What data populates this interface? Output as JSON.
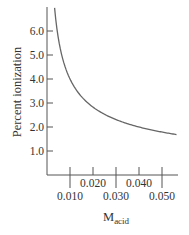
{
  "chart_data": {
    "type": "line",
    "title": "",
    "xlabel": "M",
    "xlabel_subscript": "acid",
    "ylabel": "Percent ionization",
    "xlim": [
      0,
      0.056
    ],
    "ylim": [
      0,
      7.0
    ],
    "grid": false,
    "legend": null,
    "x_ticks_lower": [
      "0.010",
      "0.030",
      "0.050"
    ],
    "x_ticks_upper": [
      "0.020",
      "0.040"
    ],
    "x_tick_values": [
      0.01,
      0.02,
      0.03,
      0.04,
      0.05
    ],
    "y_ticks": [
      "1.0",
      "2.0",
      "3.0",
      "4.0",
      "5.0",
      "6.0"
    ],
    "y_tick_values": [
      1.0,
      2.0,
      3.0,
      4.0,
      5.0,
      6.0
    ],
    "series": [
      {
        "name": "Percent ionization vs concentration",
        "color": "#666666",
        "x": [
          0.0033,
          0.004,
          0.005,
          0.006,
          0.008,
          0.01,
          0.015,
          0.02,
          0.025,
          0.03,
          0.035,
          0.04,
          0.045,
          0.05,
          0.056
        ],
        "values": [
          7.0,
          6.3,
          5.7,
          5.2,
          4.5,
          4.0,
          3.3,
          2.8,
          2.5,
          2.3,
          2.1,
          2.0,
          1.9,
          1.8,
          1.7
        ]
      }
    ]
  },
  "labels": {
    "y_axis": "Percent ionization",
    "x_axis_main": "M",
    "x_axis_sub": "acid"
  }
}
